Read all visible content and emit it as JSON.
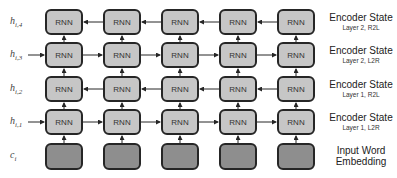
{
  "diagram": {
    "cell_label": "RNN",
    "columns": 5,
    "colors": {
      "rnn_fill": "#c6c6c6",
      "embedding_fill": "#8e8e8e",
      "border": "#262626",
      "arrow": "#262626"
    },
    "rows": [
      {
        "id": "h4",
        "left_label": "h",
        "left_sub": "i,4",
        "direction": "R2L",
        "right_main": "Encoder State",
        "right_sub": "Layer 2, R2L"
      },
      {
        "id": "h3",
        "left_label": "h",
        "left_sub": "i,3",
        "direction": "L2R",
        "right_main": "Encoder State",
        "right_sub": "Layer 2, L2R"
      },
      {
        "id": "h2",
        "left_label": "h",
        "left_sub": "i,2",
        "direction": "R2L",
        "right_main": "Encoder State",
        "right_sub": "Layer 1, R2L"
      },
      {
        "id": "h1",
        "left_label": "h",
        "left_sub": "i,1",
        "direction": "L2R",
        "right_main": "Encoder State",
        "right_sub": "Layer 1, L2R"
      },
      {
        "id": "c",
        "left_label": "c",
        "left_sub": "i",
        "direction": "none",
        "right_main": "Input Word",
        "right_sub": "Embedding"
      }
    ]
  }
}
